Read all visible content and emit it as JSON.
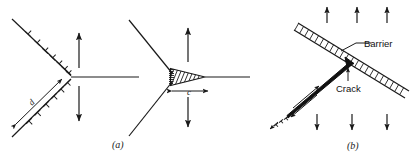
{
  "figure": {
    "panels": [
      {
        "id": "a",
        "caption": "(a)",
        "description": "Dislocation pile-up against a barrier and the resulting wedge crack",
        "labels": [
          {
            "name": "pileup-length",
            "text": "d"
          },
          {
            "name": "crack-length",
            "text": "c"
          }
        ],
        "stress_arrows": {
          "left_up_count": 1,
          "left_down_count": 1,
          "right_up_count": 1,
          "right_down_count": 1
        },
        "dislocation_symbol_counts": {
          "upper_arm": 6,
          "lower_arm": 6
        }
      },
      {
        "id": "b",
        "caption": "(b)",
        "description": "Crack nucleated at a grain boundary barrier by a dislocation pile-up",
        "labels": [
          {
            "name": "barrier-label",
            "text": "Barrier"
          },
          {
            "name": "crack-label",
            "text": "Crack"
          }
        ],
        "stress_arrows": {
          "top_up_count": 3,
          "bottom_down_count": 3
        }
      }
    ]
  },
  "colors": {
    "ink": "#1a1a1a",
    "fill": "#111111",
    "background": "#ffffff"
  }
}
